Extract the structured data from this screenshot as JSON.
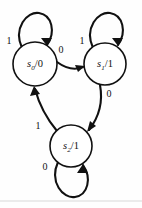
{
  "diagram": {
    "kind": "state-transition-diagram",
    "background_color": "#fefefe",
    "ink_color": "#111111",
    "states": [
      {
        "id": "s0",
        "name": "s",
        "subscript": "0",
        "separator": "/",
        "output": "0",
        "full_label": "s0/0",
        "cx": 35,
        "cy": 64,
        "r": 22
      },
      {
        "id": "s1",
        "name": "s",
        "subscript": "1",
        "separator": "/",
        "output": "1",
        "full_label": "s1/1",
        "cx": 105,
        "cy": 64,
        "r": 21
      },
      {
        "id": "s2",
        "name": "s",
        "subscript": "2",
        "separator": "/",
        "output": "1",
        "full_label": "s2/1",
        "cx": 71,
        "cy": 146,
        "r": 21
      }
    ],
    "transitions": [
      {
        "id": "s0-self",
        "from": "s0",
        "to": "s0",
        "input": "1",
        "kind": "self-loop",
        "label_x": 9,
        "label_y": 42
      },
      {
        "id": "s1-self",
        "from": "s1",
        "to": "s1",
        "input": "1",
        "kind": "self-loop",
        "label_x": 82,
        "label_y": 42
      },
      {
        "id": "s2-self",
        "from": "s2",
        "to": "s2",
        "input": "0",
        "kind": "self-loop",
        "label_x": 45,
        "label_y": 168
      },
      {
        "id": "s0-to-s1",
        "from": "s0",
        "to": "s1",
        "input": "0",
        "kind": "edge",
        "label_x": 61,
        "label_y": 51
      },
      {
        "id": "s1-to-s2",
        "from": "s1",
        "to": "s2",
        "input": "0",
        "kind": "edge",
        "label_x": 109,
        "label_y": 95
      },
      {
        "id": "s2-to-s0",
        "from": "s2",
        "to": "s0",
        "input": "1",
        "kind": "edge",
        "label_x": 38,
        "label_y": 127
      }
    ]
  }
}
